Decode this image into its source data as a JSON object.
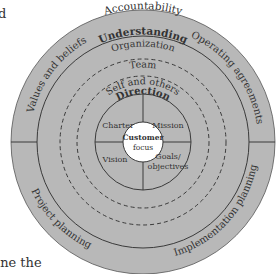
{
  "page": {
    "edge_fragments": {
      "top_left": "d",
      "bottom_left": "ine the"
    }
  },
  "diagram": {
    "colors": {
      "fill": "#b8b8b8",
      "line": "#3a3a3a",
      "text": "#333333",
      "center_fill": "#ffffff"
    },
    "outer_ring": {
      "top_label": "Accountability",
      "quadrants": [
        {
          "position": "top-left",
          "label": "Values and beliefs"
        },
        {
          "position": "top-right",
          "label": "Operating agreements"
        },
        {
          "position": "bottom-left",
          "label": "Project planning"
        },
        {
          "position": "bottom-right",
          "label": "Implementation planning"
        }
      ]
    },
    "understanding_ring": {
      "label": "Understanding",
      "levels": [
        "Organization",
        "Team",
        "Self and others"
      ]
    },
    "direction_circle": {
      "label": "Direction",
      "quadrants": [
        {
          "position": "top-left",
          "label": "Charter"
        },
        {
          "position": "top-right",
          "label": "Mission"
        },
        {
          "position": "bottom-left",
          "label": "Vision"
        },
        {
          "position": "bottom-right",
          "label_line1": "Goals/",
          "label_line2": "objectives"
        }
      ]
    },
    "center": {
      "label_line1": "Customer",
      "label_line2": "focus"
    }
  }
}
